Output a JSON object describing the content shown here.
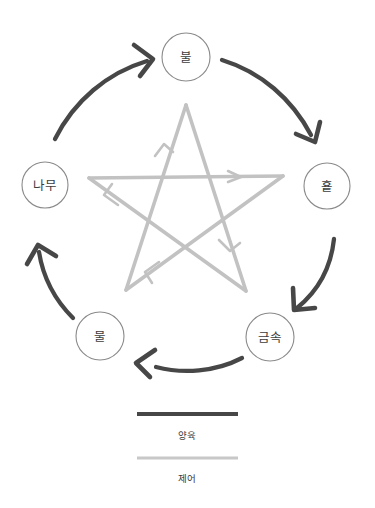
{
  "diagram": {
    "type": "wu-xing-five-elements-cycle",
    "background_color": "#ffffff",
    "nodes": [
      {
        "id": "fire",
        "label": "불",
        "cx": 186,
        "cy": 57,
        "r": 24
      },
      {
        "id": "earth",
        "label": "훁",
        "cx": 327,
        "cy": 186,
        "r": 23
      },
      {
        "id": "metal",
        "label": "금속",
        "cx": 270,
        "cy": 337,
        "r": 24
      },
      {
        "id": "water",
        "label": "물",
        "cx": 100,
        "cy": 336,
        "r": 24
      },
      {
        "id": "wood",
        "label": "나무",
        "cx": 45,
        "cy": 185,
        "r": 23
      }
    ],
    "generating_cycle": {
      "name": "양육",
      "color": "#474747",
      "stroke_width": 4.2,
      "edges": [
        {
          "from": "wood",
          "to": "fire"
        },
        {
          "from": "fire",
          "to": "earth"
        },
        {
          "from": "earth",
          "to": "metal"
        },
        {
          "from": "metal",
          "to": "water"
        },
        {
          "from": "water",
          "to": "wood"
        }
      ]
    },
    "control_cycle": {
      "name": "제어",
      "color": "#c2c2c2",
      "stroke_width": 3.6,
      "edges": [
        {
          "from": "wood",
          "to": "earth"
        },
        {
          "from": "earth",
          "to": "water"
        },
        {
          "from": "water",
          "to": "fire"
        },
        {
          "from": "fire",
          "to": "metal"
        },
        {
          "from": "metal",
          "to": "wood"
        }
      ]
    }
  },
  "legend": {
    "items": [
      {
        "id": "nurture",
        "label": "양육",
        "color": "#474747",
        "stroke_width": 4.2
      },
      {
        "id": "control",
        "label": "제어",
        "color": "#c8c8c8",
        "stroke_width": 3.2
      }
    ]
  }
}
